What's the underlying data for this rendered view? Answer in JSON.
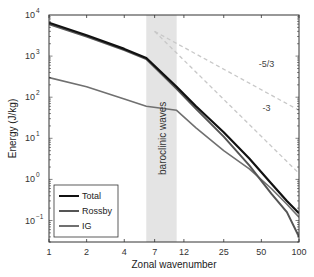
{
  "chart_data": {
    "type": "line",
    "title": "",
    "xlabel": "Zonal wavenumber",
    "ylabel": "Energy (J/kg)",
    "xscale": "log",
    "yscale": "log",
    "xlim": [
      1,
      100
    ],
    "ylim": [
      0.03,
      10000
    ],
    "xticks": [
      1,
      2,
      4,
      7,
      12,
      25,
      50,
      100
    ],
    "xtick_labels": [
      "1",
      "2",
      "4",
      "7",
      "12",
      "25",
      "50",
      "100"
    ],
    "yticks": [
      0.1,
      1,
      10,
      100,
      1000,
      10000
    ],
    "ytick_labels": [
      "10^-1",
      "10^0",
      "10^1",
      "10^2",
      "10^3",
      "10^4"
    ],
    "grid": false,
    "legend_position": "lower left",
    "shaded_region": {
      "x_start": 6,
      "x_end": 10.5,
      "label": "baroclinic waves",
      "color": "#e4e4e4"
    },
    "series": [
      {
        "name": "Total",
        "color": "#111111",
        "width": 2.2,
        "x": [
          1,
          2,
          4,
          6,
          10.5,
          15,
          25,
          40,
          60,
          80,
          100
        ],
        "values": [
          6500,
          3200,
          1500,
          900,
          180,
          60,
          14,
          3.2,
          0.8,
          0.3,
          0.15
        ]
      },
      {
        "name": "Rossby",
        "color": "#555555",
        "width": 2.0,
        "x": [
          1,
          2,
          4,
          6,
          10.5,
          15,
          25,
          40,
          60,
          80,
          100
        ],
        "values": [
          6000,
          3000,
          1400,
          850,
          160,
          52,
          11,
          2.2,
          0.45,
          0.16,
          0.04
        ]
      },
      {
        "name": "IG",
        "color": "#707070",
        "width": 1.6,
        "x": [
          1,
          2,
          4,
          6,
          10.5,
          15,
          25,
          40,
          60,
          80,
          100
        ],
        "values": [
          300,
          180,
          90,
          60,
          48,
          18,
          5,
          1.8,
          0.6,
          0.25,
          0.12
        ]
      }
    ],
    "reference_lines": [
      {
        "slope_label": "-5/3",
        "slope": -1.6667,
        "color": "#c8c8c8",
        "style": "dashed",
        "x": [
          7,
          100
        ],
        "values": [
          4000,
          48
        ]
      },
      {
        "slope_label": "-3",
        "slope": -3,
        "color": "#c8c8c8",
        "style": "dashed",
        "x": [
          7,
          100
        ],
        "values": [
          4000,
          1.4
        ]
      }
    ],
    "annotations": [
      {
        "text": "-5/3",
        "x": 55,
        "y": 550
      },
      {
        "text": "-3",
        "x": 55,
        "y": 45
      },
      {
        "text": "baroclinic waves",
        "x": 8,
        "y": 10,
        "rotation": -90
      }
    ]
  },
  "legend": {
    "items": [
      {
        "label": "Total",
        "color": "#111111"
      },
      {
        "label": "Rossby",
        "color": "#555555"
      },
      {
        "label": "IG",
        "color": "#707070"
      }
    ]
  }
}
